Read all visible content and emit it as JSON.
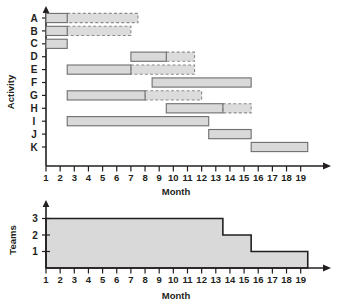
{
  "figure": {
    "title": "",
    "gantt_axis_label_y": "Activity",
    "gantt_axis_label_x": "Month",
    "hist_axis_label_y": "Teams",
    "hist_axis_label_x": "Month"
  },
  "colors": {
    "bar_fill": "#d9d9d9",
    "bar_solid_stroke": "#6e6e6e",
    "bar_float_stroke": "#8c8c8c",
    "axis": "#231f20",
    "background": "#ffffff"
  },
  "month_ticks": [
    "1",
    "2",
    "3",
    "4",
    "5",
    "6",
    "7",
    "8",
    "9",
    "10",
    "11",
    "12",
    "13",
    "14",
    "15",
    "16",
    "17",
    "18",
    "19"
  ],
  "teams_ticks": [
    "1",
    "2",
    "3"
  ],
  "activity_labels": [
    "A",
    "B",
    "C",
    "D",
    "E",
    "F",
    "G",
    "H",
    "I",
    "J",
    "K"
  ],
  "chart_data": [
    {
      "type": "bar",
      "subtype": "gantt",
      "title": "",
      "xlabel": "Month",
      "ylabel": "Activity",
      "xlim": [
        1,
        19.8
      ],
      "ylim_categories": [
        "A",
        "B",
        "C",
        "D",
        "E",
        "F",
        "G",
        "H",
        "I",
        "J",
        "K"
      ],
      "grid": false,
      "legend": [],
      "xticks": [
        1,
        2,
        3,
        4,
        5,
        6,
        7,
        8,
        9,
        10,
        11,
        12,
        13,
        14,
        15,
        16,
        17,
        18,
        19
      ],
      "bars": [
        {
          "activity": "A",
          "start": 1.0,
          "end": 2.5,
          "duration": 1.5,
          "float_start": 2.5,
          "float_end": 7.5,
          "float": 5.0
        },
        {
          "activity": "B",
          "start": 1.0,
          "end": 2.5,
          "duration": 1.5,
          "float_start": 2.5,
          "float_end": 7.0,
          "float": 4.5
        },
        {
          "activity": "C",
          "start": 1.0,
          "end": 2.5,
          "duration": 1.5,
          "float_start": null,
          "float_end": null,
          "float": 0
        },
        {
          "activity": "D",
          "start": 7.0,
          "end": 9.5,
          "duration": 2.5,
          "float_start": 9.5,
          "float_end": 11.5,
          "float": 2.0
        },
        {
          "activity": "E",
          "start": 2.5,
          "end": 7.0,
          "duration": 4.5,
          "float_start": 7.0,
          "float_end": 11.5,
          "float": 4.5
        },
        {
          "activity": "F",
          "start": 8.5,
          "end": 15.5,
          "duration": 7.0,
          "float_start": null,
          "float_end": null,
          "float": 0
        },
        {
          "activity": "G",
          "start": 2.5,
          "end": 8.0,
          "duration": 5.5,
          "float_start": 8.0,
          "float_end": 12.0,
          "float": 4.0
        },
        {
          "activity": "H",
          "start": 9.5,
          "end": 13.5,
          "duration": 4.0,
          "float_start": 13.5,
          "float_end": 15.5,
          "float": 2.0
        },
        {
          "activity": "I",
          "start": 2.5,
          "end": 12.5,
          "duration": 10.0,
          "float_start": null,
          "float_end": null,
          "float": 0
        },
        {
          "activity": "J",
          "start": 12.5,
          "end": 15.5,
          "duration": 3.0,
          "float_start": null,
          "float_end": null,
          "float": 0
        },
        {
          "activity": "K",
          "start": 15.5,
          "end": 19.5,
          "duration": 4.0,
          "float_start": null,
          "float_end": null,
          "float": 0
        }
      ]
    },
    {
      "type": "area",
      "subtype": "resource-histogram",
      "title": "",
      "xlabel": "Month",
      "ylabel": "Teams",
      "xlim": [
        1,
        19.8
      ],
      "ylim": [
        0,
        3.4
      ],
      "grid": false,
      "legend": [],
      "xticks": [
        1,
        2,
        3,
        4,
        5,
        6,
        7,
        8,
        9,
        10,
        11,
        12,
        13,
        14,
        15,
        16,
        17,
        18,
        19
      ],
      "yticks": [
        1,
        2,
        3
      ],
      "steps": [
        {
          "start": 1.0,
          "end": 13.5,
          "teams": 3
        },
        {
          "start": 13.5,
          "end": 15.5,
          "teams": 2
        },
        {
          "start": 15.5,
          "end": 19.5,
          "teams": 1
        }
      ]
    }
  ]
}
